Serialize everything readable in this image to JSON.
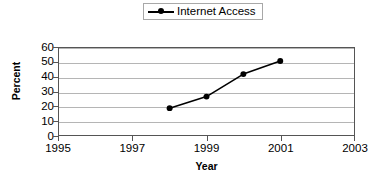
{
  "chart_data": {
    "type": "line",
    "title": "",
    "xlabel": "Year",
    "ylabel": "Percent",
    "xlim": [
      1995,
      2003
    ],
    "ylim": [
      0,
      60
    ],
    "grid": true,
    "legend_position": "top-center",
    "x_ticks": [
      1995,
      1997,
      1999,
      2001,
      2003
    ],
    "x_tick_labels": [
      "1995",
      "1997",
      "1999",
      "2001",
      "2003"
    ],
    "y_ticks": [
      0,
      10,
      20,
      30,
      40,
      50,
      60
    ],
    "y_tick_labels": [
      "0",
      "10",
      "20",
      "30",
      "40",
      "50",
      "60"
    ],
    "series": [
      {
        "name": "Internet Access",
        "color": "#000000",
        "marker": "circle",
        "x": [
          1998,
          1999,
          2000,
          2001
        ],
        "values": [
          18.5,
          26.5,
          42,
          51
        ]
      }
    ]
  },
  "legend": {
    "items": [
      {
        "label": "Internet Access",
        "symbol": "line-marker-icon"
      }
    ]
  },
  "axes": {
    "y_title": "Percent",
    "x_title": "Year"
  }
}
